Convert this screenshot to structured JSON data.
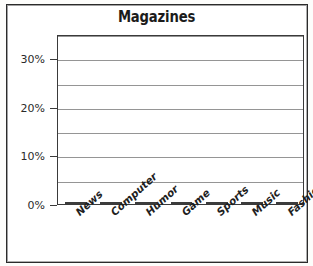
{
  "chart_data": {
    "type": "bar",
    "title": "Magazines",
    "xlabel": "",
    "ylabel": "",
    "categories": [
      "News",
      "Computer",
      "Humor",
      "Game",
      "Sports",
      "Music",
      "Fashion"
    ],
    "values": [
      2,
      2,
      5,
      20,
      22.5,
      22.5,
      25
    ],
    "value_suffix": "%",
    "ylim": [
      0,
      35
    ],
    "ytick_labels": [
      "0%",
      "10%",
      "20%",
      "30%"
    ],
    "ytick_values": [
      0,
      10,
      20,
      30
    ],
    "gridline_values": [
      5,
      10,
      15,
      20,
      25,
      30,
      35
    ],
    "grid": true,
    "legend": "none",
    "bar_styles": [
      "solid-dark",
      "solid-dark",
      "solid-dark",
      "gradient-gray",
      "gradient-gray",
      "gradient-gray",
      "gradient-gray"
    ]
  },
  "colors": {
    "frame": "#2b2b2b",
    "plot_border": "#3a3a3a",
    "gridline": "#8a8a8a",
    "bar_small": "#515151",
    "bar_tall": "#9a9a9a",
    "title_text": "#1b1b1b",
    "axis_text": "#2a2a2a"
  }
}
